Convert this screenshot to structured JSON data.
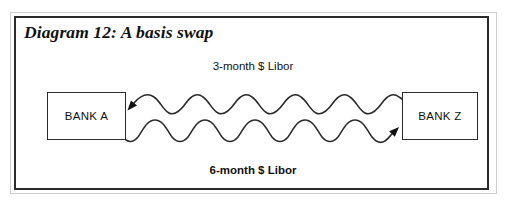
{
  "figure": {
    "title": "Diagram 12: A basis swap",
    "frame_color": "#2b2b2b",
    "background_color": "#ffffff",
    "line_color": "#2b2b2b"
  },
  "parties": [
    {
      "id": "bank-a",
      "label": "BANK A"
    },
    {
      "id": "bank-z",
      "label": "BANK Z"
    }
  ],
  "legs": [
    {
      "id": "top-leg",
      "label": "3-month $ Libor",
      "direction": "right-to-left",
      "from": "BANK Z",
      "to": "BANK A",
      "bold": false
    },
    {
      "id": "bottom-leg",
      "label": "6-month $ Libor",
      "direction": "left-to-right",
      "from": "BANK A",
      "to": "BANK Z",
      "bold": true
    }
  ]
}
